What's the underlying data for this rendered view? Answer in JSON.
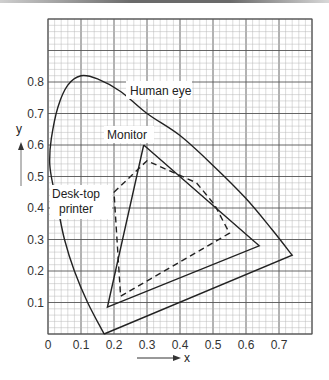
{
  "chart_data": {
    "type": "line",
    "title": "",
    "xlabel": "x",
    "ylabel": "y",
    "xlim": [
      0,
      0.8
    ],
    "ylim": [
      0,
      1.0
    ],
    "grid": true,
    "x_ticks": [
      "0",
      "0.1",
      "0.2",
      "0.3",
      "0.4",
      "0.5",
      "0.6",
      "0.7"
    ],
    "y_ticks": [
      "0.1",
      "0.2",
      "0.3",
      "0.4",
      "0.5",
      "0.6",
      "0.7",
      "0.8"
    ],
    "series": [
      {
        "name": "Human eye",
        "style": "solid",
        "points": [
          [
            0.17,
            0.0
          ],
          [
            0.12,
            0.1
          ],
          [
            0.08,
            0.2
          ],
          [
            0.05,
            0.3
          ],
          [
            0.03,
            0.4
          ],
          [
            0.01,
            0.5
          ],
          [
            0.005,
            0.55
          ],
          [
            0.01,
            0.62
          ],
          [
            0.03,
            0.72
          ],
          [
            0.06,
            0.79
          ],
          [
            0.1,
            0.82
          ],
          [
            0.15,
            0.81
          ],
          [
            0.22,
            0.77
          ],
          [
            0.3,
            0.7
          ],
          [
            0.4,
            0.63
          ],
          [
            0.5,
            0.535
          ],
          [
            0.6,
            0.43
          ],
          [
            0.68,
            0.33
          ],
          [
            0.74,
            0.25
          ],
          [
            0.17,
            0.0
          ]
        ]
      },
      {
        "name": "Monitor",
        "style": "solid",
        "points": [
          [
            0.29,
            0.6
          ],
          [
            0.64,
            0.28
          ],
          [
            0.18,
            0.085
          ],
          [
            0.29,
            0.6
          ]
        ]
      },
      {
        "name": "Desk-top printer",
        "style": "dashed",
        "points": [
          [
            0.2,
            0.45
          ],
          [
            0.3,
            0.55
          ],
          [
            0.45,
            0.48
          ],
          [
            0.505,
            0.41
          ],
          [
            0.55,
            0.32
          ],
          [
            0.22,
            0.12
          ],
          [
            0.2,
            0.45
          ]
        ]
      }
    ],
    "annotations": [
      {
        "text": "Human eye",
        "x": 0.25,
        "y": 0.78
      },
      {
        "text": "Monitor",
        "x": 0.25,
        "y": 0.63
      },
      {
        "text": "Desk-top printer",
        "x": 0.09,
        "y": 0.41
      }
    ]
  },
  "labels": {
    "human_eye": "Human eye",
    "monitor": "Monitor",
    "printer_line1": "Desk-top",
    "printer_line2": "printer",
    "x_axis": "x",
    "y_axis": "y"
  }
}
